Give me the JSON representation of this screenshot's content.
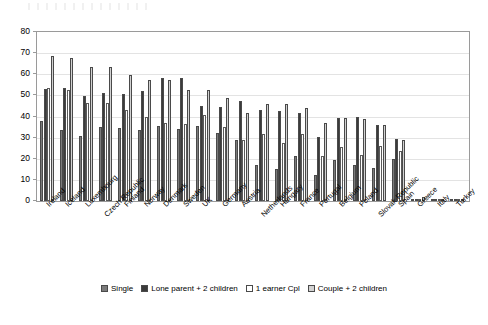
{
  "chart": {
    "type": "bar",
    "title": "",
    "xlabel": "",
    "ylabel": "",
    "ylim": [
      0,
      80
    ],
    "ytick_step": 10,
    "grid": true,
    "legend_position": "bottom"
  },
  "axis": {
    "yticks": [
      "80",
      "70",
      "60",
      "50",
      "40",
      "30",
      "20",
      "10",
      "0"
    ]
  },
  "legend": {
    "items": [
      {
        "label": "Single",
        "color": "#7b7b7b",
        "series_key": "single"
      },
      {
        "label": "Lone parent + 2 children",
        "color": "#3b3b3b",
        "series_key": "lone_parent"
      },
      {
        "label": "1 earner Cpl",
        "color": "#ffffff",
        "series_key": "one_earner_cpl"
      },
      {
        "label": "Couple + 2 children",
        "color": "#d2d2d2",
        "series_key": "couple"
      }
    ]
  },
  "chart_data": {
    "type": "bar",
    "title": "",
    "xlabel": "",
    "ylabel": "",
    "ylim": [
      0,
      80
    ],
    "grid": true,
    "legend_position": "bottom",
    "categories": [
      "Ireland",
      "Iceland",
      "Luxembourg",
      "Czech Republic",
      "Finland",
      "Norway",
      "Denmark",
      "Sweden",
      "UK",
      "Germany",
      "Austria",
      "Netherlands",
      "Hungary",
      "France",
      "Portugal",
      "Belgium",
      "Poland",
      "Slovak Republic",
      "Spain",
      "Greece",
      "Italy",
      "Turkey"
    ],
    "series": [
      {
        "name": "Single",
        "color": "#7b7b7b",
        "values": [
          38,
          33.5,
          31,
          35,
          34.5,
          33.5,
          35.5,
          34,
          35.5,
          32,
          29,
          17,
          15,
          21.5,
          12.5,
          19.5,
          17,
          15.5,
          20,
          1,
          0,
          0
        ]
      },
      {
        "name": "Lone parent + 2 children",
        "color": "#3b3b3b",
        "values": [
          53,
          53.5,
          49.5,
          51,
          50.5,
          52,
          58,
          58,
          45,
          44.5,
          47.5,
          43,
          42.5,
          41.5,
          30.5,
          39.5,
          40,
          36,
          29.5,
          1,
          0,
          0
        ]
      },
      {
        "name": "1 earner Cpl",
        "color": "#ffffff",
        "values": [
          53.5,
          52.5,
          46.5,
          46.5,
          43,
          40,
          37,
          36.5,
          40.5,
          35,
          29,
          31.5,
          27.5,
          31.5,
          21.5,
          25.5,
          22,
          26,
          23.5,
          0.5,
          0,
          0
        ]
      },
      {
        "name": "Couple + 2 children",
        "color": "#d2d2d2",
        "values": [
          68.5,
          67.5,
          63.5,
          63.5,
          59.5,
          57.5,
          57.5,
          52.5,
          52.5,
          49,
          41.5,
          46,
          46,
          44,
          37,
          39.5,
          39,
          36,
          29,
          2,
          0,
          0
        ]
      }
    ]
  }
}
